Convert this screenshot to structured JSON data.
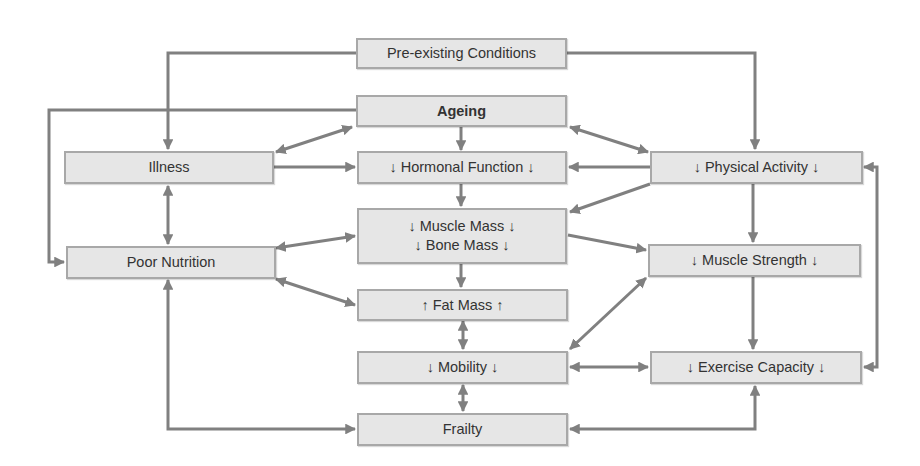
{
  "diagram": {
    "type": "flowchart",
    "colors": {
      "node_fill": "#e6e6e6",
      "node_border": "#a8a8a8",
      "arrow": "#808080",
      "text": "#333333"
    },
    "nodes": {
      "preexisting": {
        "label": "Pre-existing Conditions"
      },
      "ageing": {
        "label": "Ageing"
      },
      "illness": {
        "label": "Illness"
      },
      "hormonal": {
        "label": "↓ Hormonal Function ↓"
      },
      "physical_activity": {
        "label": "↓ Physical Activity ↓"
      },
      "muscle_mass": {
        "label": "↓ Muscle Mass ↓"
      },
      "bone_mass": {
        "label": "↓ Bone Mass ↓"
      },
      "poor_nutrition": {
        "label": "Poor Nutrition"
      },
      "muscle_strength": {
        "label": "↓ Muscle Strength ↓"
      },
      "fat_mass": {
        "label": "↑ Fat Mass ↑"
      },
      "mobility": {
        "label": "↓ Mobility ↓"
      },
      "exercise_capacity": {
        "label": "↓ Exercise Capacity ↓"
      },
      "frailty": {
        "label": "Frailty"
      }
    },
    "edges": [
      {
        "from": "Pre-existing Conditions",
        "to": "Illness",
        "direction": "one-way"
      },
      {
        "from": "Pre-existing Conditions",
        "to": "↓ Physical Activity ↓",
        "direction": "one-way"
      },
      {
        "from": "Ageing",
        "to": "Poor Nutrition",
        "direction": "one-way"
      },
      {
        "from": "Ageing",
        "to": "Illness",
        "direction": "two-way"
      },
      {
        "from": "Ageing",
        "to": "↓ Physical Activity ↓",
        "direction": "two-way"
      },
      {
        "from": "Ageing",
        "to": "↓ Hormonal Function ↓",
        "direction": "one-way"
      },
      {
        "from": "Illness",
        "to": "↓ Hormonal Function ↓",
        "direction": "one-way"
      },
      {
        "from": "Illness",
        "to": "Poor Nutrition",
        "direction": "two-way"
      },
      {
        "from": "↓ Physical Activity ↓",
        "to": "↓ Hormonal Function ↓",
        "direction": "one-way"
      },
      {
        "from": "↓ Physical Activity ↓",
        "to": "↓ Muscle Mass ↓ / ↓ Bone Mass ↓",
        "direction": "one-way"
      },
      {
        "from": "↓ Physical Activity ↓",
        "to": "↓ Muscle Strength ↓",
        "direction": "one-way"
      },
      {
        "from": "↓ Physical Activity ↓",
        "to": "↓ Exercise Capacity ↓",
        "direction": "two-way"
      },
      {
        "from": "↓ Hormonal Function ↓",
        "to": "↓ Muscle Mass ↓ / ↓ Bone Mass ↓",
        "direction": "one-way"
      },
      {
        "from": "Poor Nutrition",
        "to": "↓ Muscle Mass ↓ / ↓ Bone Mass ↓",
        "direction": "two-way"
      },
      {
        "from": "Poor Nutrition",
        "to": "↑ Fat Mass ↑",
        "direction": "two-way"
      },
      {
        "from": "Poor Nutrition",
        "to": "Frailty",
        "direction": "two-way"
      },
      {
        "from": "↓ Muscle Mass ↓ / ↓ Bone Mass ↓",
        "to": "↑ Fat Mass ↑",
        "direction": "one-way"
      },
      {
        "from": "↓ Muscle Mass ↓ / ↓ Bone Mass ↓",
        "to": "↓ Muscle Strength ↓",
        "direction": "one-way"
      },
      {
        "from": "↑ Fat Mass ↑",
        "to": "↓ Mobility ↓",
        "direction": "two-way"
      },
      {
        "from": "↓ Muscle Strength ↓",
        "to": "↓ Mobility ↓",
        "direction": "two-way"
      },
      {
        "from": "↓ Muscle Strength ↓",
        "to": "↓ Exercise Capacity ↓",
        "direction": "one-way"
      },
      {
        "from": "↓ Mobility ↓",
        "to": "↓ Exercise Capacity ↓",
        "direction": "two-way"
      },
      {
        "from": "↓ Mobility ↓",
        "to": "Frailty",
        "direction": "two-way"
      },
      {
        "from": "↓ Exercise Capacity ↓",
        "to": "Frailty",
        "direction": "two-way"
      }
    ]
  }
}
